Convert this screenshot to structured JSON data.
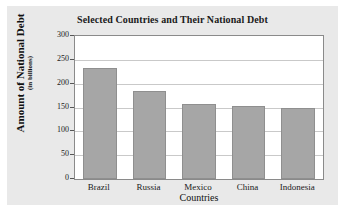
{
  "figure": {
    "background_color": "#e9e9e9",
    "page_background_color": "#ffffff",
    "plot_background_color": "#ffffff",
    "plot_border_color": "#8a8a8a",
    "gridline_color": "#c9c9c9",
    "bar_fill_color": "#a6a6a6",
    "bar_edge_color": "#8f8f8f",
    "text_color": "#1a1a1a"
  },
  "chart_data": {
    "type": "bar",
    "title": "Selected Countries and Their National Debt",
    "xlabel": "Countries",
    "ylabel": "Amount of National Debt",
    "ylabel_sub": "(in billions)",
    "categories": [
      "Brazil",
      "Russia",
      "Mexico",
      "China",
      "Indonesia"
    ],
    "values": [
      232,
      184,
      158,
      153,
      148
    ],
    "ylim": [
      0,
      300
    ],
    "ytick_labels": [
      "300",
      "250",
      "200",
      "150",
      "100",
      "50",
      "0"
    ],
    "ytick_values": [
      300,
      250,
      200,
      150,
      100,
      50,
      0
    ],
    "grid": true,
    "grid_axis": "y",
    "legend": null,
    "legend_position": "none",
    "orientation": "vertical",
    "series": [
      {
        "name": "Amount of National Debt",
        "values": [
          232,
          184,
          158,
          153,
          148
        ]
      }
    ]
  }
}
